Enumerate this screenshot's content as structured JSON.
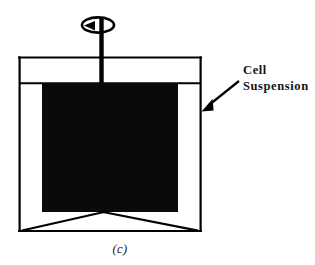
{
  "figure": {
    "caption": "(c)",
    "kind": "bioreactor-schematic",
    "background_color": "#ffffff",
    "ink_color": "#000000"
  },
  "annotations": [
    {
      "id": "cell-suspension",
      "line1": "Cell",
      "line2": "Suspension",
      "pointer": "arrow-pointing-left-down"
    }
  ],
  "diagram": {
    "vessel": {
      "name": "reactor-vessel",
      "left": 19,
      "right": 201,
      "top": 57,
      "bottom": 231,
      "stroke_width": 2.2
    },
    "lid_line_y": 57,
    "liquid_surface_y": 83,
    "suspension": {
      "name": "cell-suspension-fill",
      "left": 42,
      "right": 178,
      "top": 83,
      "bottom": 212,
      "fill": "#000000"
    },
    "impeller_shaft": {
      "x": 101.5,
      "top": 20,
      "bottom": 83,
      "width": 4.4
    },
    "rotation_indicator": {
      "name": "rotation-ellipse",
      "cx": 98,
      "cy": 25,
      "rx": 16,
      "ry": 7.5,
      "arrow_head": "counter-clockwise"
    },
    "support_legs": {
      "apex_x": 103,
      "apex_y": 212,
      "left_foot_x": 22,
      "right_foot_x": 198,
      "foot_y": 231
    },
    "pointer_arrow": {
      "from_x": 238,
      "from_y": 82,
      "to_x": 202,
      "to_y": 110
    }
  }
}
